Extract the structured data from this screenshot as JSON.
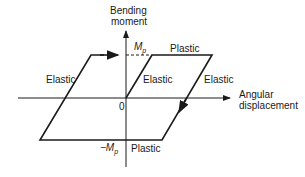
{
  "diagram": {
    "y_axis_label_line1": "Bending",
    "y_axis_label_line2": "moment",
    "x_axis_label_line1": "Angular",
    "x_axis_label_line2": "displacement",
    "origin_label": "0",
    "mp_symbol": "M",
    "mp_subscript": "p",
    "neg_mp_prefix": "−M",
    "neg_mp_subscript": "p",
    "labels": {
      "plastic_top": "Plastic",
      "plastic_bottom": "Plastic",
      "elastic_left": "Elastic",
      "elastic_inner": "Elastic",
      "elastic_right": "Elastic"
    },
    "line_color": "#1a1a1a"
  }
}
